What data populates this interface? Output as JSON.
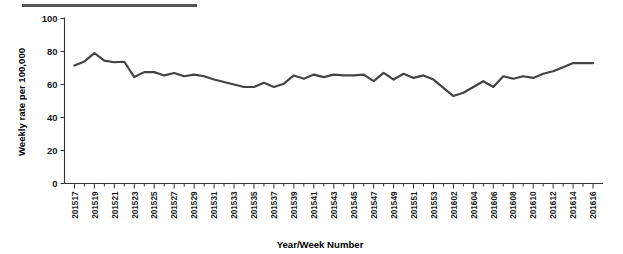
{
  "figure": {
    "top_rule": true,
    "line_color": "#444444",
    "axis_color": "#333333",
    "background": "#ffffff"
  },
  "chart_data": {
    "type": "line",
    "title": "",
    "xlabel": "Year/Week Number",
    "ylabel": "Weekly rate per 100,000",
    "ylim": [
      0,
      100
    ],
    "yticks": [
      0,
      20,
      40,
      60,
      80,
      100
    ],
    "grid": false,
    "legend": "none",
    "series_color": "#444444",
    "categories": [
      "201517",
      "201518",
      "201519",
      "201520",
      "201521",
      "201522",
      "201523",
      "201524",
      "201525",
      "201526",
      "201527",
      "201528",
      "201529",
      "201530",
      "201531",
      "201532",
      "201533",
      "201534",
      "201535",
      "201536",
      "201537",
      "201538",
      "201539",
      "201540",
      "201541",
      "201542",
      "201543",
      "201544",
      "201545",
      "201546",
      "201547",
      "201548",
      "201549",
      "201550",
      "201551",
      "201552",
      "201553",
      "201601",
      "201602",
      "201603",
      "201604",
      "201605",
      "201606",
      "201607",
      "201608",
      "201609",
      "201610",
      "201611",
      "201612",
      "201613",
      "201614",
      "201615",
      "201616"
    ],
    "tick_labels": [
      "201517",
      "201519",
      "201521",
      "201523",
      "201525",
      "201527",
      "201529",
      "201531",
      "201533",
      "201535",
      "201537",
      "201539",
      "201541",
      "201543",
      "201545",
      "201547",
      "201549",
      "201551",
      "201553",
      "201602",
      "201604",
      "201606",
      "201608",
      "201610",
      "201612",
      "201614",
      "201616"
    ],
    "values": [
      71.5,
      74.0,
      79.0,
      74.5,
      73.5,
      73.8,
      64.5,
      67.5,
      67.5,
      65.5,
      67.0,
      65.0,
      66.0,
      65.0,
      63.0,
      61.5,
      60.0,
      58.5,
      58.5,
      61.0,
      58.5,
      60.5,
      65.5,
      63.5,
      66.0,
      64.5,
      66.0,
      65.5,
      65.5,
      66.0,
      62.0,
      67.0,
      63.0,
      66.5,
      64.0,
      65.5,
      63.0,
      58.0,
      53.0,
      55.0,
      58.5,
      62.0,
      58.5,
      65.0,
      63.5,
      65.0,
      64.0,
      66.5,
      68.0,
      70.5,
      73.0,
      73.0,
      73.0
    ],
    "values_tail": [
      68.0,
      63.5,
      65.0,
      64.0,
      67.0
    ],
    "summary": {
      "maximum": 79.0,
      "maximum_at": "201519",
      "minimum": 53.0,
      "minimum_at": "201551"
    }
  }
}
